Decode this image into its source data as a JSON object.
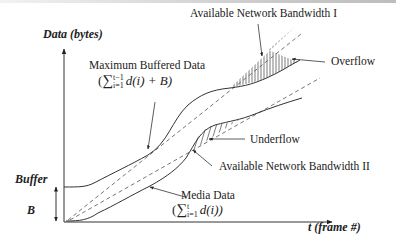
{
  "diagram": {
    "type": "buffer-bandwidth-diagram",
    "axes": {
      "y_label": "Data (bytes)",
      "x_label": "t (frame #)"
    },
    "buffer": {
      "label_line1": "Buffer",
      "label_line2": "B"
    },
    "curves": {
      "max_buffered": {
        "label": "Maximum Buffered Data",
        "formula_prefix": "(",
        "formula_sum": "∑",
        "formula_sup": "t−1",
        "formula_sub": "i=1",
        "formula_body": "d(i) + B)"
      },
      "media_data": {
        "label": "Media Data",
        "formula_prefix": "(",
        "formula_sum": "∑",
        "formula_sup": "t",
        "formula_sub": "i=1",
        "formula_body": "d(i))"
      },
      "bandwidth_1": {
        "label": "Available Network Bandwidth I"
      },
      "bandwidth_2": {
        "label": "Available Network Bandwidth II"
      }
    },
    "regions": {
      "overflow": {
        "label": "Overflow"
      },
      "underflow": {
        "label": "Underflow"
      }
    },
    "colors": {
      "line": "#333333",
      "dashed": "#666666",
      "topbar": "#c8c8c8"
    }
  }
}
